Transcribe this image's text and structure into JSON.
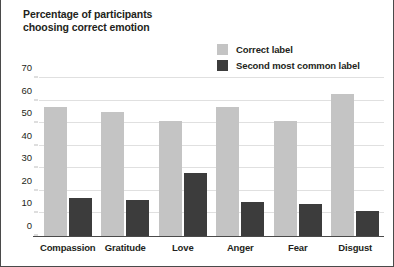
{
  "chart_data": {
    "type": "bar",
    "title": "Percentage of participants choosing correct emotion",
    "xlabel": "",
    "ylabel": "Percentage of participants choosing correct emotion",
    "categories": [
      "Compassion",
      "Gratitude",
      "Love",
      "Anger",
      "Fear",
      "Disgust"
    ],
    "series": [
      {
        "name": "Correct label",
        "color": "#c4c4c4",
        "values": [
          57,
          55,
          51,
          57,
          51,
          63
        ]
      },
      {
        "name": "Second most common label",
        "color": "#3c3c3c",
        "values": [
          17,
          16,
          28,
          15,
          14,
          11
        ]
      }
    ],
    "ylim": [
      0,
      70
    ],
    "yticks": [
      0,
      10,
      20,
      30,
      40,
      50,
      60,
      70
    ],
    "ytick_labels": [
      "0",
      "10",
      "20",
      "30",
      "40",
      "50",
      "60",
      "70"
    ],
    "grid": true,
    "legend_position": "top-right"
  },
  "legend": {
    "items": [
      {
        "label": "Correct label",
        "color": "#c4c4c4"
      },
      {
        "label": "Second most common label",
        "color": "#3c3c3c"
      }
    ]
  },
  "colors": {
    "correct_label": "#c4c4c4",
    "second_most_common_label": "#3c3c3c",
    "axis": "#4a4a4a",
    "gridline": "#e0e0e0",
    "text": "#231f20",
    "background": "#ffffff"
  }
}
